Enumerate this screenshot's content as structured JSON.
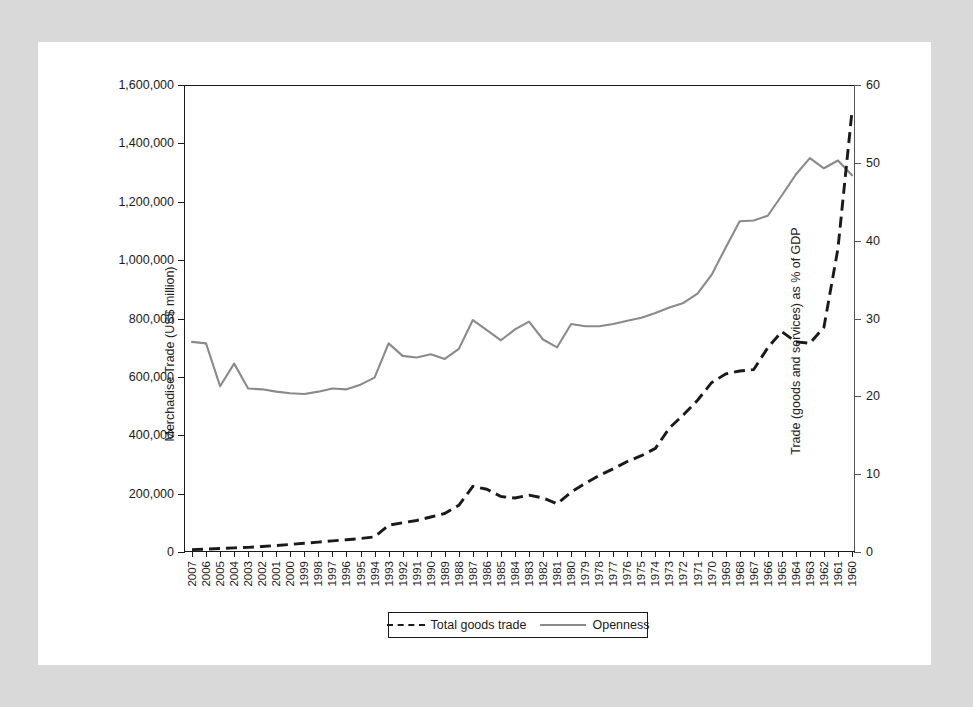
{
  "figure": {
    "background": "#ffffff",
    "mat_color": "#d9d9d9"
  },
  "chart_data": {
    "type": "line",
    "title": "",
    "xlabel": "",
    "ylabel": "Merchadise Trade (US$ million)",
    "y2label": "Trade (goods and services) as % of GDP",
    "grid": false,
    "legend_position": "bottom",
    "ylim": [
      0,
      1600000
    ],
    "y2lim": [
      0,
      60
    ],
    "yticks": [
      0,
      200000,
      400000,
      600000,
      800000,
      1000000,
      1200000,
      1400000,
      1600000
    ],
    "ytick_labels": [
      "0",
      "200,000",
      "400,000",
      "600,000",
      "800,000",
      "1,000,000",
      "1,200,000",
      "1,400,000",
      "1,600,000"
    ],
    "y2ticks": [
      0,
      10,
      20,
      30,
      40,
      50,
      60
    ],
    "y2tick_labels": [
      "0",
      "10",
      "20",
      "30",
      "40",
      "50",
      "60"
    ],
    "categories": [
      "2007",
      "2006",
      "2005",
      "2004",
      "2003",
      "2002",
      "2001",
      "2000",
      "1999",
      "1998",
      "1997",
      "1996",
      "1995",
      "1994",
      "1993",
      "1992",
      "1991",
      "1990",
      "1989",
      "1988",
      "1987",
      "1986",
      "1985",
      "1984",
      "1983",
      "1982",
      "1981",
      "1980",
      "1979",
      "1978",
      "1977",
      "1976",
      "1975",
      "1974",
      "1973",
      "1972",
      "1971",
      "1970",
      "1969",
      "1968",
      "1967",
      "1966",
      "1965",
      "1964",
      "1963",
      "1962",
      "1961",
      "1960"
    ],
    "series": [
      {
        "name": "Total goods trade",
        "axis": "left",
        "style": "dashed",
        "color": "#1a1a1a",
        "units": "US$ million",
        "values": [
          8000,
          10000,
          12000,
          14000,
          16000,
          19000,
          22000,
          26000,
          30000,
          34000,
          38000,
          42000,
          46000,
          52000,
          92000,
          100000,
          108000,
          120000,
          132000,
          160000,
          225000,
          215000,
          190000,
          185000,
          195000,
          185000,
          165000,
          205000,
          235000,
          262000,
          285000,
          310000,
          330000,
          355000,
          425000,
          470000,
          520000,
          580000,
          610000,
          620000,
          625000,
          700000,
          755000,
          720000,
          715000,
          770000,
          1040000,
          1510000
        ]
      },
      {
        "name": "Openness",
        "axis": "right",
        "style": "solid",
        "color": "#8a8a8a",
        "units": "% of GDP",
        "values": [
          27.0,
          26.8,
          21.3,
          24.2,
          21.0,
          20.9,
          20.6,
          20.4,
          20.3,
          20.6,
          21.0,
          20.9,
          21.5,
          22.4,
          26.8,
          25.2,
          25.0,
          25.4,
          24.8,
          26.1,
          29.8,
          28.5,
          27.2,
          28.6,
          29.6,
          27.3,
          26.3,
          29.3,
          29.0,
          29.0,
          29.3,
          29.7,
          30.1,
          30.7,
          31.4,
          32.0,
          33.2,
          35.6,
          39.1,
          42.5,
          42.6,
          43.2,
          45.8,
          48.5,
          50.6,
          49.3,
          50.3,
          48.4
        ]
      }
    ]
  },
  "legend": {
    "items": [
      {
        "label": "Total goods trade",
        "style": "dashed",
        "color": "#1a1a1a"
      },
      {
        "label": "Openness",
        "style": "solid",
        "color": "#8a8a8a"
      }
    ]
  }
}
